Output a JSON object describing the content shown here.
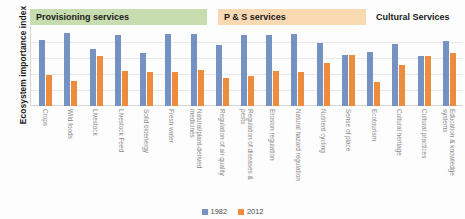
{
  "chart_data": {
    "type": "bar",
    "title": "",
    "xlabel": "",
    "ylabel": "Ecosystem importance index",
    "ylim": [
      0,
      100
    ],
    "grid": true,
    "legend_position": "bottom",
    "categories": [
      "Crops",
      "Wild foods",
      "Livestock",
      "Livestock Feed",
      "Solid bioenergy",
      "Fresh water",
      "Natural/plant-derived medicines",
      "Regulation of air quality",
      "Regulation of diseases & pests",
      "Erosion regulation",
      "Natural hazard regulation",
      "Nutrient cycling",
      "Sense of place",
      "Ecotourism",
      "Cultural heritage",
      "Cultural practices",
      "Education & knowledge systems"
    ],
    "series": [
      {
        "name": "1982",
        "color": "#7592c2",
        "values": [
          82,
          91,
          71,
          89,
          66,
          90,
          90,
          76,
          89,
          89,
          90,
          79,
          64,
          67,
          77,
          63,
          81
        ]
      },
      {
        "name": "2012",
        "color": "#ed8c3c",
        "values": [
          39,
          31,
          63,
          44,
          43,
          42,
          45,
          35,
          38,
          44,
          43,
          54,
          64,
          30,
          51,
          63,
          66
        ]
      }
    ],
    "group_bands": [
      {
        "label": "Provisioning services",
        "color": "#c7ddb0",
        "categories": 7
      },
      {
        "label": "P & S services",
        "color": "#f8d9b2",
        "categories": 5
      },
      {
        "label": "Cultural Services",
        "color": "transparent",
        "categories": 5
      }
    ]
  },
  "legend": {
    "items": [
      {
        "label": "1982"
      },
      {
        "label": "2012"
      }
    ]
  }
}
